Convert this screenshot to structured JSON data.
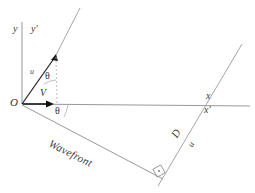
{
  "figure": {
    "background_color": "#ffffff",
    "line_color": "#6e6e6e",
    "bold_line_color": "#1a1a1a",
    "text_color": "#2b2b2b"
  },
  "labels": {
    "axis_y": "y",
    "axis_y_prime": "y′",
    "origin": "O",
    "u_top": "u",
    "theta_top": "θ",
    "velocity": "V",
    "theta_bottom": "θ",
    "axis_x": "x",
    "axis_x_prime": "x′",
    "wavefront": "Wavefront",
    "distance_d": "D",
    "u_right": "u"
  },
  "icons": {
    "arrowhead_velocity": "arrowhead-right-icon",
    "arrowhead_u": "arrowhead-diagonal-icon",
    "right_angle_marker": "right-angle-icon"
  },
  "geometry": {
    "origin": [
      22,
      104
    ],
    "y_axis_top": [
      22,
      22
    ],
    "x_axis_right": [
      250,
      105
    ],
    "u_arrow_tip": [
      56,
      55
    ],
    "y_prime_far": [
      80,
      8
    ],
    "v_arrow_tip": [
      52,
      105
    ],
    "wavefront_end": [
      162,
      179
    ],
    "x_prime_low": [
      158,
      186
    ],
    "x_prime_high": [
      242,
      44
    ],
    "x_prime_crossing": [
      205,
      105
    ],
    "right_angle_marker": [
      157,
      170
    ],
    "theta_top_deg": 22,
    "theta_bottom_deg": 26.5
  }
}
